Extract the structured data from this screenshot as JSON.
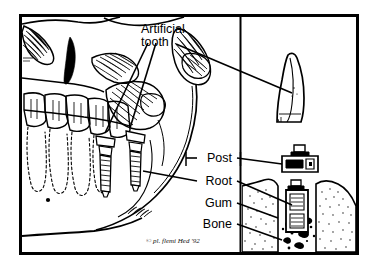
{
  "figure": {
    "title_visible": false,
    "type": "anatomical-line-drawing",
    "border_color": "#000000",
    "background_color": "#ffffff",
    "ink_color": "#000000",
    "panels": {
      "left": {
        "name": "skull-jaw-view",
        "description": "lateral line drawing of human skull lower face, mandible, teeth with dashed root outlines, and two threaded implants"
      },
      "right": {
        "name": "component-detail-column",
        "description": "exploded detail column showing artificial tooth crown, post, and root implanted in gum and bone cross-section"
      }
    },
    "labels": [
      {
        "id": "artificial-tooth",
        "text_line1": "Artificial",
        "text_line2": "tooth",
        "text": "Artificial tooth",
        "x": 141,
        "y": 33,
        "align": "start",
        "target": "crown-detail"
      },
      {
        "id": "post",
        "text": "Post",
        "x": 232,
        "y": 158,
        "align": "end",
        "target": "post-detail"
      },
      {
        "id": "root",
        "text": "Root",
        "x": 232,
        "y": 181,
        "align": "end",
        "target": "root-detail"
      },
      {
        "id": "gum",
        "text": "Gum",
        "x": 232,
        "y": 203,
        "align": "end",
        "target": "gum-detail"
      },
      {
        "id": "bone",
        "text": "Bone",
        "x": 232,
        "y": 224,
        "align": "end",
        "target": "bone-detail"
      }
    ],
    "signature": {
      "text": "© pl. flemi Hed '92",
      "x": 146,
      "y": 243,
      "legible": false
    }
  }
}
